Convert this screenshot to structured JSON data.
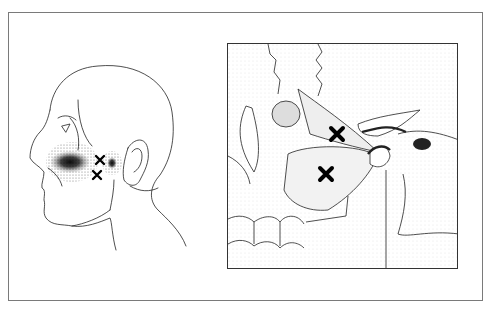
{
  "figure": {
    "left_panel": {
      "subject": "head-profile-left-facing",
      "trigger_points": [
        {
          "label": "x",
          "cx": 100,
          "cy": 160
        },
        {
          "label": "x",
          "cx": 97,
          "cy": 175
        }
      ],
      "referred_pain_zones": [
        {
          "name": "cheek-maxillary",
          "cx": 70,
          "cy": 162
        },
        {
          "name": "preauricular-tmj",
          "cx": 112,
          "cy": 163
        }
      ]
    },
    "right_panel": {
      "subject": "lateral-pterygoid-anatomy",
      "trigger_points": [
        {
          "label": "x",
          "cx": 109,
          "cy": 90
        },
        {
          "label": "x",
          "cx": 98,
          "cy": 130
        }
      ]
    },
    "colors": {
      "line": "#222222",
      "frame": "#7a7a7a",
      "stipple": "#111111",
      "background": "#ffffff"
    }
  }
}
